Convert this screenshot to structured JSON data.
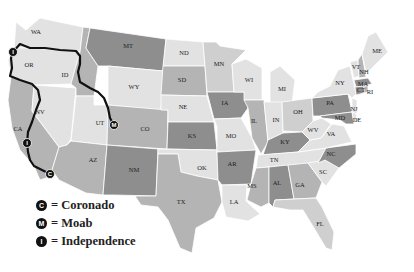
{
  "map": {
    "title": "United States route map",
    "colors": {
      "light": "#e2e2e2",
      "mid_light": "#cfcfcf",
      "mid": "#b4b4b4",
      "dark": "#8e8e8e",
      "route": "#111111"
    },
    "states": [
      {
        "abbr": "WA",
        "x": 36,
        "y": 33
      },
      {
        "abbr": "OR",
        "x": 29,
        "y": 66
      },
      {
        "abbr": "CA",
        "x": 18,
        "y": 130
      },
      {
        "abbr": "NV",
        "x": 40,
        "y": 113
      },
      {
        "abbr": "ID",
        "x": 65,
        "y": 76
      },
      {
        "abbr": "MT",
        "x": 128,
        "y": 47
      },
      {
        "abbr": "WY",
        "x": 134,
        "y": 88
      },
      {
        "abbr": "UT",
        "x": 100,
        "y": 124
      },
      {
        "abbr": "CO",
        "x": 145,
        "y": 130
      },
      {
        "abbr": "AZ",
        "x": 93,
        "y": 161
      },
      {
        "abbr": "NM",
        "x": 134,
        "y": 171
      },
      {
        "abbr": "ND",
        "x": 184,
        "y": 54
      },
      {
        "abbr": "SD",
        "x": 182,
        "y": 81
      },
      {
        "abbr": "NE",
        "x": 183,
        "y": 108
      },
      {
        "abbr": "KS",
        "x": 192,
        "y": 137
      },
      {
        "abbr": "OK",
        "x": 202,
        "y": 169
      },
      {
        "abbr": "TX",
        "x": 181,
        "y": 203
      },
      {
        "abbr": "MN",
        "x": 219,
        "y": 65
      },
      {
        "abbr": "IA",
        "x": 225,
        "y": 104
      },
      {
        "abbr": "MO",
        "x": 231,
        "y": 137
      },
      {
        "abbr": "AR",
        "x": 232,
        "y": 165
      },
      {
        "abbr": "LA",
        "x": 234,
        "y": 203
      },
      {
        "abbr": "WI",
        "x": 249,
        "y": 81
      },
      {
        "abbr": "IL",
        "x": 254,
        "y": 122
      },
      {
        "abbr": "MI",
        "x": 282,
        "y": 90
      },
      {
        "abbr": "IN",
        "x": 276,
        "y": 121
      },
      {
        "abbr": "OH",
        "x": 298,
        "y": 113
      },
      {
        "abbr": "KY",
        "x": 285,
        "y": 143
      },
      {
        "abbr": "TN",
        "x": 274,
        "y": 161
      },
      {
        "abbr": "MS",
        "x": 252,
        "y": 187
      },
      {
        "abbr": "AL",
        "x": 277,
        "y": 184
      },
      {
        "abbr": "GA",
        "x": 300,
        "y": 186
      },
      {
        "abbr": "FL",
        "x": 320,
        "y": 225
      },
      {
        "abbr": "SC",
        "x": 323,
        "y": 173
      },
      {
        "abbr": "NC",
        "x": 331,
        "y": 155
      },
      {
        "abbr": "VA",
        "x": 331,
        "y": 135
      },
      {
        "abbr": "WV",
        "x": 313,
        "y": 131
      },
      {
        "abbr": "PA",
        "x": 330,
        "y": 104
      },
      {
        "abbr": "NY",
        "x": 340,
        "y": 84
      },
      {
        "abbr": "MD",
        "x": 340,
        "y": 119
      },
      {
        "abbr": "DE",
        "x": 357,
        "y": 121
      },
      {
        "abbr": "NJ",
        "x": 354,
        "y": 110
      },
      {
        "abbr": "CT",
        "x": 361,
        "y": 91
      },
      {
        "abbr": "RI",
        "x": 370,
        "y": 93
      },
      {
        "abbr": "MA",
        "x": 363,
        "y": 85
      },
      {
        "abbr": "VT",
        "x": 356,
        "y": 68
      },
      {
        "abbr": "NH",
        "x": 364,
        "y": 73
      },
      {
        "abbr": "ME",
        "x": 377,
        "y": 52
      }
    ],
    "markers": [
      {
        "id": "independence-start",
        "letter": "I",
        "x": 13,
        "y": 52
      },
      {
        "id": "moab",
        "letter": "M",
        "x": 114,
        "y": 125
      },
      {
        "id": "independence-2",
        "letter": "I",
        "x": 27,
        "y": 143
      },
      {
        "id": "coronado",
        "letter": "C",
        "x": 50,
        "y": 174
      }
    ]
  },
  "legend": {
    "items": [
      {
        "symbol": "C",
        "label": "= Coronado"
      },
      {
        "symbol": "M",
        "label": "= Moab"
      },
      {
        "symbol": "I",
        "label": "= Independence"
      }
    ]
  }
}
